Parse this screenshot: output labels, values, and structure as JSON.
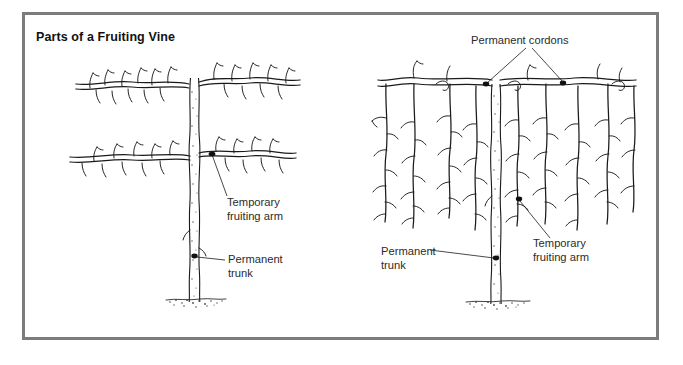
{
  "figure": {
    "title": "Parts of a Fruiting Vine",
    "frame_color": "#7c7c7c",
    "background_color": "#ffffff",
    "ink_color": "#1a1a1a"
  },
  "diagrams": [
    {
      "id": "left-vine",
      "name": "fan-trained-vine",
      "labels": [
        {
          "key": "temporary_fruiting_arm",
          "line1": "Temporary",
          "line2": "fruiting arm"
        },
        {
          "key": "permanent_trunk",
          "line1": "Permanent",
          "line2": "trunk"
        }
      ]
    },
    {
      "id": "right-vine",
      "name": "cordon-trained-vine",
      "labels": [
        {
          "key": "permanent_cordons",
          "line1": "Permanent cordons",
          "line2": ""
        },
        {
          "key": "temporary_fruiting_arm",
          "line1": "Temporary",
          "line2": "fruiting arm"
        },
        {
          "key": "permanent_trunk",
          "line1": "Permanent",
          "line2": "trunk"
        }
      ]
    }
  ],
  "callouts": {
    "left_arm_line1": "Temporary",
    "left_arm_line2": "fruiting arm",
    "left_trunk_line1": "Permanent",
    "left_trunk_line2": "trunk",
    "right_cordons": "Permanent cordons",
    "right_arm_line1": "Temporary",
    "right_arm_line2": "fruiting arm",
    "right_trunk_line1": "Permanent",
    "right_trunk_line2": "trunk"
  }
}
